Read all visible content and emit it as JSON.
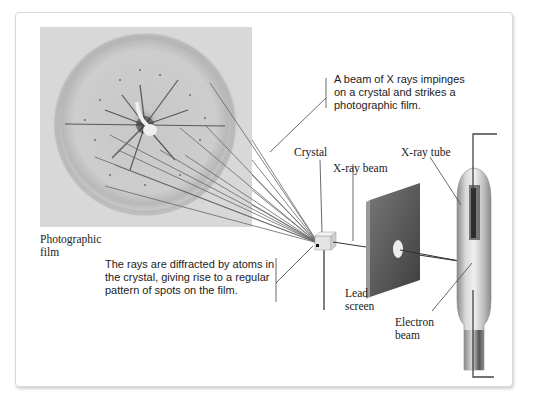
{
  "diagram": {
    "labels": {
      "photographic_film": [
        "Photographic",
        "film"
      ],
      "crystal": "Crystal",
      "xray_beam": "X-ray beam",
      "xray_tube": "X-ray tube",
      "lead_screen": [
        "Lead",
        "screen"
      ],
      "electron_beam": [
        "Electron",
        "beam"
      ]
    },
    "callouts": {
      "beam": [
        "A beam of X rays impinges",
        "on a crystal and strikes a",
        "photographic film."
      ],
      "diffraction": [
        "The rays are diffracted by atoms in",
        "the crystal, giving rise to a regular",
        "pattern of spots on the film."
      ]
    },
    "colors": {
      "film_bg": "#d9d9d9",
      "film_ring": "#b9b9b9",
      "lead_screen": "#5a5a5a",
      "tube": "#bdbdbd",
      "leader_line": "#444444",
      "panel_border": "#d8d8d8"
    }
  }
}
